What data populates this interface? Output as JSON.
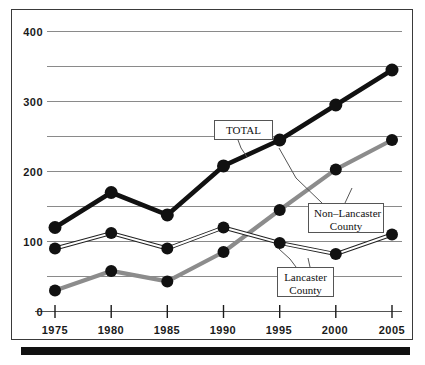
{
  "chart_data": {
    "type": "line",
    "title": "",
    "xlabel": "",
    "ylabel": "",
    "categories": [
      "1975",
      "1980",
      "1985",
      "1990",
      "1995",
      "2000",
      "2005"
    ],
    "x": [
      1975,
      1980,
      1985,
      1990,
      1995,
      2000,
      2005
    ],
    "ylim": [
      0,
      400
    ],
    "xlim": [
      1975,
      2005
    ],
    "yticks": [
      0,
      100,
      200,
      300,
      400
    ],
    "ytick_labels": [
      "0",
      "100",
      "200",
      "300",
      "400"
    ],
    "gridlines": [
      50,
      100,
      150,
      200,
      250,
      300,
      350,
      400
    ],
    "grid": true,
    "legend_position": "inline-callouts",
    "series": [
      {
        "name": "TOTAL",
        "values": [
          120,
          170,
          138,
          208,
          245,
          295,
          345
        ],
        "color": "#111111",
        "line_width": 4.5,
        "marker": "circle-filled"
      },
      {
        "name": "Lancaster County",
        "values": [
          90,
          112,
          90,
          120,
          98,
          82,
          110
        ],
        "color": "#222222",
        "line_width": 1.4,
        "marker": "circle-filled"
      },
      {
        "name": "Non-Lancaster County",
        "values": [
          30,
          58,
          43,
          85,
          145,
          203,
          245
        ],
        "color": "#8c8c8c",
        "line_width": 4.0,
        "marker": "circle-filled"
      }
    ],
    "annotations": [
      {
        "id": "total",
        "text": "TOTAL",
        "points_to_series": "TOTAL",
        "points_to_x": 1991
      },
      {
        "id": "non_lancaster",
        "text_line1": "Non–Lancaster",
        "text_line2": "County",
        "points_to_series": "Non-Lancaster County",
        "points_to_x": 1995
      },
      {
        "id": "lancaster",
        "text_line1": "Lancaster",
        "text_line2": "County",
        "points_to_series": "Lancaster County",
        "points_to_x": 1995
      }
    ],
    "colors": {
      "total": "#111111",
      "non_lancaster": "#8c8c8c",
      "lancaster": "#222222",
      "grid": "#8a8a8a",
      "axis": "#555555",
      "frame": "#3a3a3a",
      "bottom_bar": "#111111"
    }
  },
  "axis": {
    "y_ticks": [
      "400",
      "300",
      "200",
      "100",
      "0"
    ],
    "x_ticks": [
      "1975",
      "1980",
      "1985",
      "1990",
      "1995",
      "2000",
      "2005"
    ]
  },
  "callouts": {
    "total": "TOTAL",
    "non_lancaster_line1": "Non–Lancaster",
    "non_lancaster_line2": "County",
    "lancaster_line1": "Lancaster",
    "lancaster_line2": "County"
  }
}
